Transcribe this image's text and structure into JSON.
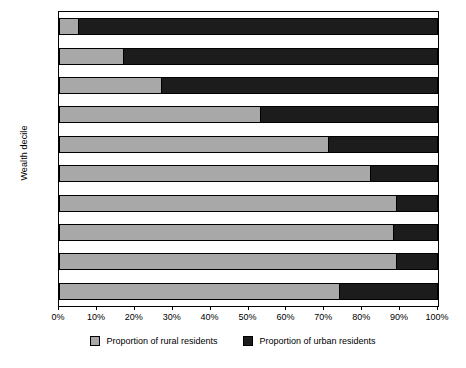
{
  "chart_data": {
    "type": "bar",
    "orientation": "horizontal",
    "stacked": true,
    "normalized": true,
    "title": "",
    "xlabel": "",
    "ylabel": "Wealth decile",
    "xlim": [
      0,
      100
    ],
    "xunit": "%",
    "grid": false,
    "legend_position": "bottom-center",
    "categories": [
      "0 (Highest)",
      "9",
      "8",
      "7",
      "6",
      "5",
      "4",
      "3",
      "2",
      "1 (Lowest)"
    ],
    "series": [
      {
        "name": "Proportion of rural residents",
        "color": "#a8a8a8",
        "values": [
          5,
          17,
          27,
          53,
          71,
          82,
          89,
          88,
          89,
          74
        ]
      },
      {
        "name": "Proportion of urban residents",
        "color": "#1c1c1c",
        "values": [
          95,
          83,
          73,
          47,
          29,
          18,
          11,
          12,
          11,
          26
        ]
      }
    ],
    "xticks": [
      {
        "value": 0,
        "label": "0%"
      },
      {
        "value": 10,
        "label": "10%"
      },
      {
        "value": 20,
        "label": "20%"
      },
      {
        "value": 30,
        "label": "30%"
      },
      {
        "value": 40,
        "label": "40%"
      },
      {
        "value": 50,
        "label": "50%"
      },
      {
        "value": 60,
        "label": "60%"
      },
      {
        "value": 70,
        "label": "70%"
      },
      {
        "value": 80,
        "label": "80%"
      },
      {
        "value": 90,
        "label": "90%"
      },
      {
        "value": 100,
        "label": "100%"
      }
    ],
    "legend": [
      {
        "label": "Proportion of rural residents",
        "color": "#a8a8a8",
        "swatch": "rural"
      },
      {
        "label": "Proportion of urban residents",
        "color": "#1c1c1c",
        "swatch": "urban"
      }
    ]
  }
}
